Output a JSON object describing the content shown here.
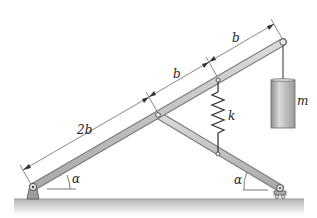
{
  "figure": {
    "colors": {
      "bar_fill": "#c8c8c8",
      "bar_stroke": "#7a7a7a",
      "ground_top": "#bdbdbd",
      "ground_fade": "#ffffff",
      "dim_line": "#6a6a6a",
      "mass_fill": "#b9b9b9",
      "text": "#222222"
    },
    "labels": {
      "dim_lower": "2b",
      "dim_middle": "b",
      "dim_upper": "b",
      "spring": "k",
      "mass": "m",
      "angle_left": "α",
      "angle_right": "α"
    }
  }
}
